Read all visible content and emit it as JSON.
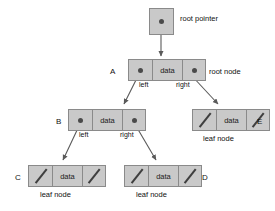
{
  "diagram": {
    "colors": {
      "box_fill": "#c9c9c9",
      "box_border": "#8a8a8a",
      "pointer_dot": "#4a4a4a",
      "null_slash": "#3f3f3f",
      "text": "#111111",
      "background": "#ffffff"
    },
    "data_cell_label": "data",
    "root_pointer": {
      "caption": "root pointer"
    },
    "nodes": [
      {
        "id": "A",
        "name_label": "A",
        "caption": "root node",
        "left_cell": "pointer",
        "data_cell": "data",
        "right_cell": "pointer"
      },
      {
        "id": "B",
        "name_label": "B",
        "caption": "",
        "left_cell": "pointer",
        "data_cell": "data",
        "right_cell": "pointer"
      },
      {
        "id": "E",
        "name_label": "E",
        "caption": "leaf node",
        "left_cell": "null",
        "data_cell": "data",
        "right_cell": "null"
      },
      {
        "id": "C",
        "name_label": "C",
        "caption": "leaf node",
        "left_cell": "null",
        "data_cell": "data",
        "right_cell": "null"
      },
      {
        "id": "D",
        "name_label": "D",
        "caption": "leaf node",
        "left_cell": "null",
        "data_cell": "data",
        "right_cell": "null"
      }
    ],
    "edge_labels": {
      "a_left": "left",
      "a_right": "right",
      "b_left": "left",
      "b_right": "right"
    }
  }
}
